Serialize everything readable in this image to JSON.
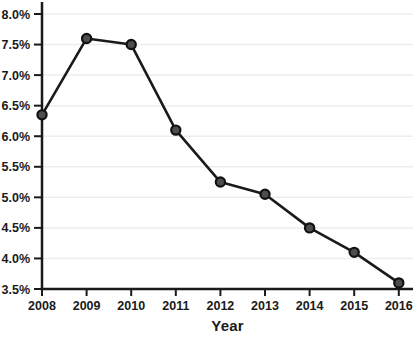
{
  "chart_data": {
    "type": "line",
    "title": "",
    "xlabel": "Year",
    "ylabel": "",
    "x": [
      2008,
      2009,
      2010,
      2011,
      2012,
      2013,
      2014,
      2015,
      2016
    ],
    "series": [
      {
        "name": "rate",
        "values": [
          6.35,
          7.6,
          7.5,
          6.1,
          5.25,
          5.05,
          4.5,
          4.1,
          3.6
        ]
      }
    ],
    "y_unit": "%",
    "ylim": [
      3.5,
      8.0
    ],
    "ytick_step": 0.5,
    "ytick_labels": [
      "3.5%",
      "4.0%",
      "4.5%",
      "5.0%",
      "5.5%",
      "6.0%",
      "6.5%",
      "7.0%",
      "7.5%",
      "8.0%"
    ],
    "xtick_labels": [
      "2008",
      "2009",
      "2010",
      "2011",
      "2012",
      "2013",
      "2014",
      "2015",
      "2016"
    ],
    "grid": "horizontal",
    "legend": "none",
    "colors": {
      "line": "#1a1a1a",
      "marker_fill": "#4d4d4d",
      "marker_stroke": "#111111",
      "grid": "#ededed",
      "axis": "#1a1a1a",
      "label": "#1a1a1a",
      "background": "#ffffff"
    }
  }
}
